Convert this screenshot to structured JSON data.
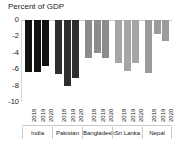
{
  "chart_data": {
    "type": "bar",
    "title": "Percent of GDP",
    "subtitle": "",
    "xlabel": "",
    "ylabel": "",
    "ylim": [
      -10,
      0
    ],
    "yticks": [
      0,
      -2,
      -4,
      -6,
      -8,
      -10
    ],
    "ytick_labels": [
      "0",
      "-2",
      "-4",
      "-6",
      "-8",
      "-10"
    ],
    "grid": false,
    "legend": "none",
    "orientation": "vertical",
    "categories": [
      "India",
      "Pakistan",
      "Bangladesh",
      "Sri Lanka",
      "Nepal"
    ],
    "x": [
      "2018",
      "2019",
      "2020"
    ],
    "groups": [
      {
        "name": "India",
        "color": "#111111",
        "points": [
          {
            "year": "2018",
            "value": -6.3
          },
          {
            "year": "2019",
            "value": -6.3
          },
          {
            "year": "2020",
            "value": -5.6
          }
        ]
      },
      {
        "name": "Pakistan",
        "color": "#2e2e2e",
        "points": [
          {
            "year": "2018",
            "value": -6.6
          },
          {
            "year": "2019",
            "value": -8.1
          },
          {
            "year": "2020",
            "value": -7.1
          }
        ]
      },
      {
        "name": "Bangladesh",
        "color": "#8c8c8c",
        "points": [
          {
            "year": "2018",
            "value": -4.6
          },
          {
            "year": "2019",
            "value": -4.0
          },
          {
            "year": "2020",
            "value": -4.6
          }
        ]
      },
      {
        "name": "Sri Lanka",
        "color": "#a6a6a6",
        "points": [
          {
            "year": "2018",
            "value": -5.3
          },
          {
            "year": "2019",
            "value": -6.2
          },
          {
            "year": "2020",
            "value": -5.2
          }
        ]
      },
      {
        "name": "Nepal",
        "color": "#9b9b9b",
        "points": [
          {
            "year": "2018",
            "value": -6.5
          },
          {
            "year": "2019",
            "value": -1.7
          },
          {
            "year": "2020",
            "value": -2.5
          }
        ]
      }
    ],
    "colors": {
      "axis": "#cfcfcf",
      "text": "#1a1a1a",
      "background": "#ffffff"
    }
  }
}
